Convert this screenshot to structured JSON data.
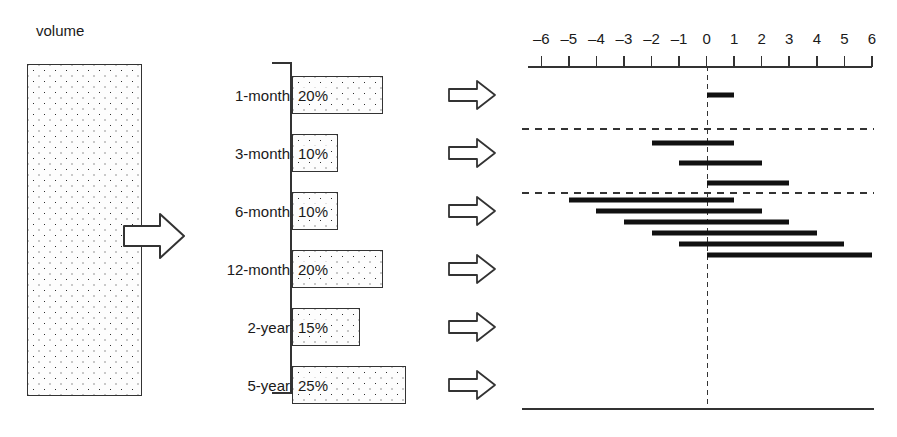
{
  "figure": {
    "volume_label": "volume",
    "arrow_icon": "right-arrow-icon"
  },
  "middle_chart": {
    "categories": [
      {
        "label": "1-month",
        "percent": "20%",
        "value": 20
      },
      {
        "label": "3-month",
        "percent": "10%",
        "value": 10
      },
      {
        "label": "6-month",
        "percent": "10%",
        "value": 10
      },
      {
        "label": "12-month",
        "percent": "20%",
        "value": 20
      },
      {
        "label": "2-year",
        "percent": "15%",
        "value": 15
      },
      {
        "label": "5-year",
        "percent": "25%",
        "value": 25
      }
    ]
  },
  "chart_data": {
    "type": "bar",
    "title": "",
    "xlabel": "",
    "ylabel": "",
    "xlim": [
      -6,
      6
    ],
    "grid": false,
    "legend": "none",
    "tick_labels": [
      "–6",
      "–5",
      "–4",
      "–3",
      "–2",
      "–1",
      "0",
      "1",
      "2",
      "3",
      "4",
      "5",
      "6"
    ],
    "ticks": [
      -6,
      -5,
      -4,
      -3,
      -2,
      -1,
      0,
      1,
      2,
      3,
      4,
      5,
      6
    ],
    "zero_reference_line": 0,
    "separator_rows_after": [
      1,
      4
    ],
    "intervals": [
      {
        "group": "1-month",
        "low": 0,
        "high": 1
      },
      {
        "group": "3-month",
        "low": -2,
        "high": 1
      },
      {
        "group": "3-month",
        "low": -1,
        "high": 2
      },
      {
        "group": "3-month",
        "low": 0,
        "high": 3
      },
      {
        "group": "6-month",
        "low": -5,
        "high": 1
      },
      {
        "group": "6-month",
        "low": -4,
        "high": 2
      },
      {
        "group": "6-month",
        "low": -3,
        "high": 3
      },
      {
        "group": "6-month",
        "low": -2,
        "high": 4
      },
      {
        "group": "6-month",
        "low": -1,
        "high": 5
      },
      {
        "group": "6-month",
        "low": 0,
        "high": 6
      }
    ]
  }
}
